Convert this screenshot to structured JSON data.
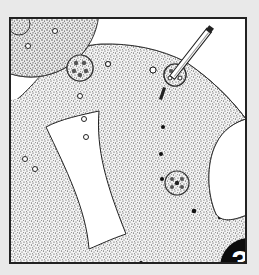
{
  "illustration": {
    "description": "Stippled ink drawing of a perforated sheet with round hole clusters, a pencil marking a hole, and a white rectangular cutout",
    "colors": {
      "background": "#e9e9e9",
      "panel": "#ffffff",
      "ink": "#222222",
      "stipple": "#3a3a3a"
    }
  },
  "badge": {
    "step_number": "3",
    "color": "#0c0c0c",
    "text_color": "#ffffff"
  }
}
